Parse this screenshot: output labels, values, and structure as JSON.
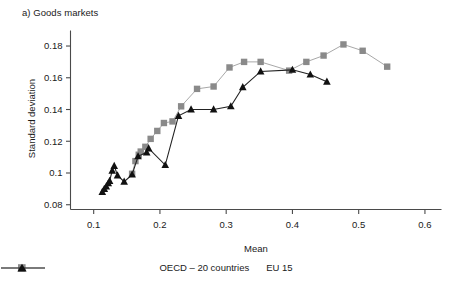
{
  "figure": {
    "panel_title": "a) Goods markets",
    "xlabel": "Mean",
    "ylabel": "Standard deviation"
  },
  "legend": {
    "position": "bottom-center",
    "entries": [
      {
        "label": "OECD – 20 countries",
        "marker": "square",
        "color": "#8a8a8a"
      },
      {
        "label": "EU 15",
        "marker": "triangle",
        "color": "#111111"
      }
    ]
  },
  "axis": {
    "x_ticks": [
      "0.1",
      "0.2",
      "0.3",
      "0.4",
      "0.5",
      "0.6"
    ],
    "y_ticks": [
      "0.08",
      "0.1",
      "0.12",
      "0.14",
      "0.16",
      "0.18"
    ]
  },
  "chart_data": {
    "type": "line",
    "title": "a) Goods markets",
    "xlabel": "Mean",
    "ylabel": "Standard deviation",
    "xlim": [
      0.065,
      0.625
    ],
    "ylim": [
      0.077,
      0.186
    ],
    "xticks": [
      0.1,
      0.2,
      0.3,
      0.4,
      0.5,
      0.6
    ],
    "yticks": [
      0.08,
      0.1,
      0.12,
      0.14,
      0.16,
      0.18
    ],
    "grid": false,
    "legend_position": "bottom-center",
    "series": [
      {
        "name": "OECD – 20 countries",
        "marker": "square",
        "color": "#8a8a8a",
        "line_color": "#a8a8a8",
        "points": [
          {
            "x": 0.158,
            "y": 0.0995
          },
          {
            "x": 0.163,
            "y": 0.1075
          },
          {
            "x": 0.168,
            "y": 0.1115
          },
          {
            "x": 0.171,
            "y": 0.1135
          },
          {
            "x": 0.178,
            "y": 0.1165
          },
          {
            "x": 0.186,
            "y": 0.1215
          },
          {
            "x": 0.196,
            "y": 0.1265
          },
          {
            "x": 0.206,
            "y": 0.1315
          },
          {
            "x": 0.219,
            "y": 0.1325
          },
          {
            "x": 0.232,
            "y": 0.142
          },
          {
            "x": 0.256,
            "y": 0.153
          },
          {
            "x": 0.281,
            "y": 0.1545
          },
          {
            "x": 0.305,
            "y": 0.1665
          },
          {
            "x": 0.327,
            "y": 0.17
          },
          {
            "x": 0.352,
            "y": 0.17
          },
          {
            "x": 0.395,
            "y": 0.1645
          },
          {
            "x": 0.421,
            "y": 0.17
          },
          {
            "x": 0.447,
            "y": 0.174
          },
          {
            "x": 0.477,
            "y": 0.181
          },
          {
            "x": 0.506,
            "y": 0.177
          },
          {
            "x": 0.543,
            "y": 0.167
          }
        ]
      },
      {
        "name": "EU 15",
        "marker": "triangle",
        "color": "#111111",
        "line_color": "#222222",
        "points": [
          {
            "x": 0.113,
            "y": 0.088
          },
          {
            "x": 0.116,
            "y": 0.09
          },
          {
            "x": 0.119,
            "y": 0.0915
          },
          {
            "x": 0.122,
            "y": 0.0935
          },
          {
            "x": 0.124,
            "y": 0.095
          },
          {
            "x": 0.128,
            "y": 0.1015
          },
          {
            "x": 0.131,
            "y": 0.1045
          },
          {
            "x": 0.136,
            "y": 0.0985
          },
          {
            "x": 0.146,
            "y": 0.0945
          },
          {
            "x": 0.158,
            "y": 0.099
          },
          {
            "x": 0.167,
            "y": 0.1105
          },
          {
            "x": 0.18,
            "y": 0.113
          },
          {
            "x": 0.183,
            "y": 0.1155
          },
          {
            "x": 0.208,
            "y": 0.105
          },
          {
            "x": 0.228,
            "y": 0.136
          },
          {
            "x": 0.247,
            "y": 0.14
          },
          {
            "x": 0.281,
            "y": 0.14
          },
          {
            "x": 0.307,
            "y": 0.142
          },
          {
            "x": 0.325,
            "y": 0.154
          },
          {
            "x": 0.352,
            "y": 0.164
          },
          {
            "x": 0.4,
            "y": 0.165
          },
          {
            "x": 0.427,
            "y": 0.162
          },
          {
            "x": 0.452,
            "y": 0.1575
          }
        ]
      }
    ]
  }
}
